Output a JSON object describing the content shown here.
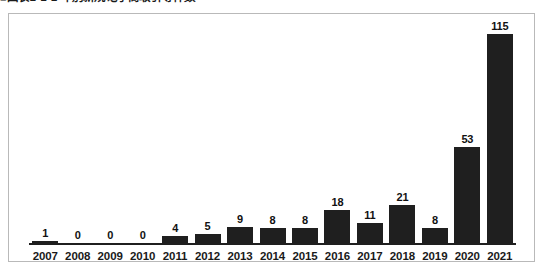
{
  "figure": {
    "caption": "■図表1-1-1 年別新規電子商取引等件数"
  },
  "chart_data": {
    "type": "bar",
    "title": "■図表1-1-1 年別新規電子商取引等件数",
    "xlabel": "",
    "ylabel": "",
    "ylim": [
      0,
      115
    ],
    "grid": false,
    "legend": "none",
    "bar_color": "#1f1f1f",
    "axis_color": "#1f1f1f",
    "frame_color": "#b9b9b9",
    "categories": [
      "2007",
      "2008",
      "2009",
      "2010",
      "2011",
      "2012",
      "2013",
      "2014",
      "2015",
      "2016",
      "2017",
      "2018",
      "2019",
      "2020",
      "2021"
    ],
    "values": [
      1,
      0,
      0,
      0,
      4,
      5,
      9,
      8,
      8,
      18,
      11,
      21,
      8,
      53,
      115
    ],
    "labels": [
      "1",
      "0",
      "0",
      "0",
      "4",
      "5",
      "9",
      "8",
      "8",
      "18",
      "11",
      "21",
      "8",
      "53",
      "115"
    ]
  }
}
